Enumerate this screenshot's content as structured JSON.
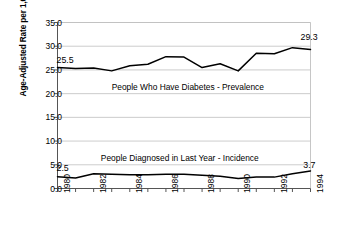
{
  "chart_data": {
    "type": "line",
    "title": "",
    "xlabel": "",
    "ylabel": "Age-Adjusted Rate per 1,000 Population",
    "x": [
      1980,
      1981,
      1982,
      1983,
      1984,
      1985,
      1986,
      1987,
      1988,
      1989,
      1990,
      1991,
      1992,
      1993,
      1994
    ],
    "xtick_labels": [
      "1980",
      "1982",
      "1984",
      "1986",
      "1988",
      "1990",
      "1992",
      "1994"
    ],
    "xtick_values": [
      1980,
      1982,
      1984,
      1986,
      1988,
      1990,
      1992,
      1994
    ],
    "ytick_labels": [
      "0.0",
      "5.0",
      "10.0",
      "15.0",
      "20.0",
      "25.0",
      "30.0",
      "35.0"
    ],
    "ytick_values": [
      0.0,
      5.0,
      10.0,
      15.0,
      20.0,
      25.0,
      30.0,
      35.0
    ],
    "ylim": [
      0.0,
      35.0
    ],
    "xlim": [
      1980,
      1994
    ],
    "grid": "horizontal",
    "legend": "none",
    "line_color": "#000000",
    "grid_color": "#bfbfbf",
    "axis_color": "#808080",
    "background": "#ffffff",
    "series": [
      {
        "name": "People Who Have Diabetes - Prevalence",
        "annotation": "People Who Have Diabetes - Prevalence",
        "start_label": "25.5",
        "end_label": "29.3",
        "values": [
          25.5,
          25.3,
          25.4,
          24.8,
          25.9,
          26.2,
          27.8,
          27.7,
          25.5,
          26.3,
          24.8,
          28.5,
          28.4,
          29.7,
          29.3
        ]
      },
      {
        "name": "People Diagnosed in Last Year - Incidence",
        "annotation": "People Diagnosed in Last Year - Incidence",
        "start_label": "2.5",
        "end_label": "3.7",
        "values": [
          2.5,
          2.2,
          3.1,
          3.0,
          2.9,
          2.9,
          3.0,
          3.0,
          2.8,
          2.6,
          2.1,
          2.4,
          2.4,
          3.1,
          3.7
        ]
      }
    ]
  }
}
